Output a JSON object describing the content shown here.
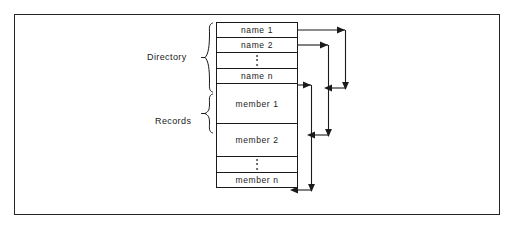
{
  "figure": {
    "name": "directory-and-records-layout-diagram",
    "frame_color": "#262626",
    "line_color": "#1a1a1a",
    "background": "#ffffff"
  },
  "labels": {
    "directory": "Directory",
    "records": "Records"
  },
  "blocks": {
    "directory_rows": [
      {
        "id": "name-1",
        "text": "name 1",
        "kind": "entry"
      },
      {
        "id": "name-2",
        "text": "name 2",
        "kind": "entry"
      },
      {
        "id": "dir-ellipsis",
        "text": "⋮",
        "kind": "ellipsis"
      },
      {
        "id": "name-n",
        "text": "name n",
        "kind": "entry"
      }
    ],
    "record_rows": [
      {
        "id": "member-1",
        "text": "member 1",
        "kind": "entry"
      },
      {
        "id": "member-2",
        "text": "member 2",
        "kind": "entry"
      },
      {
        "id": "rec-ellipsis",
        "text": "⋮",
        "kind": "ellipsis"
      },
      {
        "id": "member-n",
        "text": "member n",
        "kind": "entry"
      }
    ]
  },
  "pointers": [
    {
      "id": "pointer-name-1-to-member-1",
      "from": "name 1",
      "to": "member 1"
    },
    {
      "id": "pointer-name-2-to-member-2",
      "from": "name 2",
      "to": "member 2"
    },
    {
      "id": "pointer-name-n-to-member-n",
      "from": "name n",
      "to": "member n"
    }
  ]
}
